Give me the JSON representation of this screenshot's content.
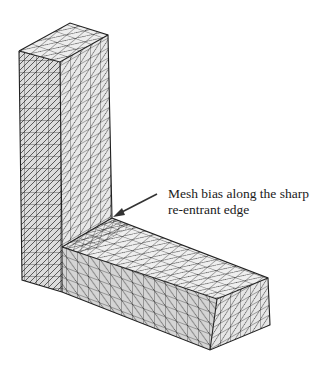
{
  "figure": {
    "annotation": {
      "line1": "Mesh bias along the sharp",
      "line2": "re-entrant edge"
    },
    "colors": {
      "face_light": "#e6e6e6",
      "face_mid": "#d4d4d4",
      "face_dark": "#c6c6c6",
      "mesh_line": "#222222",
      "arrow": "#333333",
      "text": "#1a1a1a"
    }
  }
}
